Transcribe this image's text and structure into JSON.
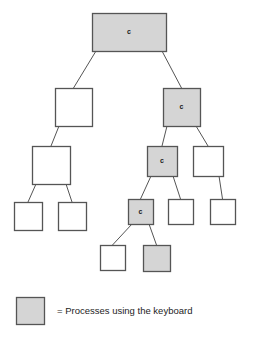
{
  "figure": {
    "type": "process-tree-diagram",
    "background_color": "#ffffff",
    "node_stroke_color": "#555555",
    "shaded_fill": "#d5d5d5",
    "unshaded_fill": "#ffffff",
    "edge_color": "#555555",
    "label_text": "c"
  },
  "nodes": [
    {
      "id": "n0",
      "label": "c",
      "shaded": true,
      "x": 92,
      "y": 13,
      "w": 74,
      "h": 38
    },
    {
      "id": "n1",
      "label": "",
      "shaded": false,
      "x": 55,
      "y": 88,
      "w": 37,
      "h": 38
    },
    {
      "id": "n2",
      "label": "c",
      "shaded": true,
      "x": 163,
      "y": 88,
      "w": 37,
      "h": 38
    },
    {
      "id": "n3",
      "label": "",
      "shaded": false,
      "x": 32,
      "y": 146,
      "w": 38,
      "h": 38
    },
    {
      "id": "n4",
      "label": "c",
      "shaded": true,
      "x": 147,
      "y": 146,
      "w": 30,
      "h": 30
    },
    {
      "id": "n5",
      "label": "",
      "shaded": false,
      "x": 193,
      "y": 146,
      "w": 30,
      "h": 30
    },
    {
      "id": "n6",
      "label": "",
      "shaded": false,
      "x": 14,
      "y": 202,
      "w": 28,
      "h": 28
    },
    {
      "id": "n7",
      "label": "",
      "shaded": false,
      "x": 58,
      "y": 202,
      "w": 28,
      "h": 28
    },
    {
      "id": "n8",
      "label": "c",
      "shaded": true,
      "x": 128,
      "y": 199,
      "w": 25,
      "h": 25
    },
    {
      "id": "n9",
      "label": "",
      "shaded": false,
      "x": 168,
      "y": 199,
      "w": 25,
      "h": 25
    },
    {
      "id": "n10",
      "label": "",
      "shaded": false,
      "x": 210,
      "y": 199,
      "w": 25,
      "h": 25
    },
    {
      "id": "n11",
      "label": "",
      "shaded": false,
      "x": 100,
      "y": 245,
      "w": 25,
      "h": 25
    },
    {
      "id": "n12",
      "label": "",
      "shaded": true,
      "x": 143,
      "y": 245,
      "w": 27,
      "h": 26
    }
  ],
  "edges": [
    {
      "from": "n0",
      "to": "n1"
    },
    {
      "from": "n0",
      "to": "n2"
    },
    {
      "from": "n1",
      "to": "n3"
    },
    {
      "from": "n2",
      "to": "n4"
    },
    {
      "from": "n2",
      "to": "n5"
    },
    {
      "from": "n3",
      "to": "n6"
    },
    {
      "from": "n3",
      "to": "n7"
    },
    {
      "from": "n4",
      "to": "n8"
    },
    {
      "from": "n4",
      "to": "n9"
    },
    {
      "from": "n5",
      "to": "n10"
    },
    {
      "from": "n8",
      "to": "n11"
    },
    {
      "from": "n8",
      "to": "n12"
    }
  ],
  "legend": {
    "swatch": {
      "x": 16,
      "y": 297,
      "w": 28,
      "h": 27,
      "shaded": true
    },
    "text": "= Processes using the keyboard",
    "text_x": 57,
    "text_y": 311
  }
}
